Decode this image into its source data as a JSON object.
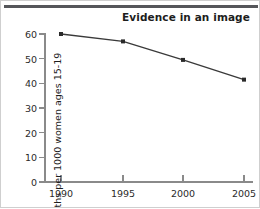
{
  "chart_data": {
    "type": "line",
    "title": "Evidence in an image",
    "xlabel": "",
    "ylabel": "Births per 1000 women ages 15-19",
    "categories": [
      "1990",
      "1995",
      "2000",
      "2005"
    ],
    "x": [
      1990,
      1995,
      2000,
      2005
    ],
    "values": [
      60,
      57,
      49.5,
      41.5
    ],
    "series": [
      {
        "name": "Births per 1000 women ages 15-19",
        "values": [
          60,
          57,
          49.5,
          41.5
        ]
      }
    ],
    "ylim": [
      0,
      60
    ],
    "yticks": [
      0,
      10,
      20,
      30,
      40,
      50,
      60
    ],
    "ytick_labels": [
      "0",
      "10",
      "20",
      "30",
      "40",
      "50",
      "60"
    ],
    "xticks": [
      1990,
      1995,
      2000,
      2005
    ],
    "xtick_labels": [
      "1990",
      "1995",
      "2000",
      "2005"
    ],
    "grid": false,
    "legend": false,
    "marker": "square",
    "line_color": "#3a3a3a",
    "marker_color": "#2a2a2a",
    "axis_color": "#8a8a8a",
    "title_color": "#1d1d1d",
    "background_color": "#ffffff"
  }
}
